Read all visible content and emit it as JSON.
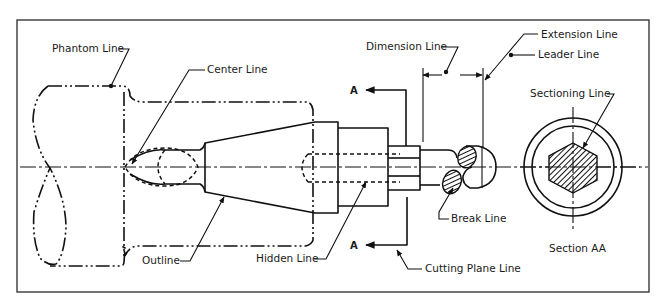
{
  "figure": {
    "section_marker": "A",
    "labels": {
      "phantom_line": "Phantom Line",
      "center_line": "Center Line",
      "dimension_line": "Dimension Line",
      "extension_line": "Extension Line",
      "leader_line": "Leader Line",
      "sectioning_line": "Sectioning Line",
      "break_line": "Break Line",
      "outline": "Outline",
      "hidden_line": "Hidden Line",
      "cutting_plane_line": "Cutting Plane Line",
      "section_aa": "Section AA"
    },
    "cutting_plane": {
      "top_marker": "A",
      "bottom_marker": "A"
    },
    "colors": {
      "line": "#111111",
      "frame": "#2a2a2a",
      "background": "#ffffff"
    }
  }
}
